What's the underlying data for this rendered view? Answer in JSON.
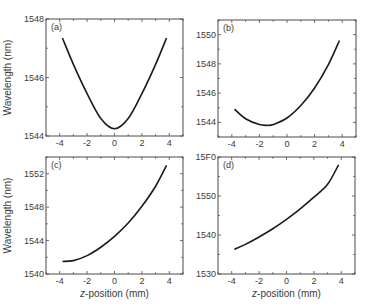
{
  "figure": {
    "xlabel": "z-position (mm)",
    "ylabel": "Wavelength (nm)"
  },
  "chart_data": [
    {
      "type": "line",
      "panel": "(a)",
      "xlabel": "",
      "ylabel": "Wavelength (nm)",
      "xlim": [
        -5,
        5
      ],
      "ylim": [
        1544,
        1548
      ],
      "xticks": [
        -4,
        -2,
        0,
        2,
        4
      ],
      "yticks": [
        1544,
        1546,
        1548
      ],
      "x": [
        -3.8,
        -3,
        -2,
        -1,
        0,
        1,
        2,
        3,
        3.8
      ],
      "y": [
        1547.35,
        1546.45,
        1545.45,
        1544.6,
        1544.25,
        1544.6,
        1545.45,
        1546.45,
        1547.35
      ],
      "grid": false
    },
    {
      "type": "line",
      "panel": "(b)",
      "xlabel": "",
      "ylabel": "",
      "xlim": [
        -5,
        5
      ],
      "ylim": [
        1543,
        1551
      ],
      "xticks": [
        -4,
        -2,
        0,
        2,
        4
      ],
      "yticks": [
        1544,
        1546,
        1548,
        1550
      ],
      "x": [
        -3.8,
        -3,
        -2,
        -1.4,
        -1,
        0,
        1,
        2,
        3,
        3.8
      ],
      "y": [
        1544.9,
        1544.25,
        1543.85,
        1543.8,
        1543.85,
        1544.3,
        1545.15,
        1546.35,
        1547.95,
        1549.6
      ],
      "grid": false
    },
    {
      "type": "line",
      "panel": "(c)",
      "xlabel": "z-position (mm)",
      "ylabel": "Wavelength (nm)",
      "xlim": [
        -5,
        5
      ],
      "ylim": [
        1540,
        1554
      ],
      "xticks": [
        -4,
        -2,
        0,
        2,
        4
      ],
      "yticks": [
        1540,
        1544,
        1548,
        1552
      ],
      "x": [
        -3.8,
        -3,
        -2,
        -1,
        0,
        1,
        2,
        3,
        3.8
      ],
      "y": [
        1541.5,
        1541.6,
        1542.2,
        1543.2,
        1544.5,
        1546.1,
        1548.1,
        1550.5,
        1553.0
      ],
      "grid": false
    },
    {
      "type": "line",
      "panel": "(d)",
      "xlabel": "z-position (mm)",
      "ylabel": "",
      "xlim": [
        -5,
        5
      ],
      "ylim": [
        1530,
        1560
      ],
      "xticks": [
        -4,
        -2,
        0,
        2,
        4
      ],
      "yticks": [
        1530,
        1540,
        1550,
        1560
      ],
      "ytick_labels": [
        "1530",
        "1540",
        "1550",
        "15F0"
      ],
      "x": [
        -3.8,
        -3,
        -2,
        -1,
        0,
        1,
        2,
        3,
        3.8
      ],
      "y": [
        1536.3,
        1537.6,
        1539.5,
        1541.6,
        1544.0,
        1546.7,
        1549.7,
        1553.0,
        1558.0
      ],
      "grid": false
    }
  ]
}
